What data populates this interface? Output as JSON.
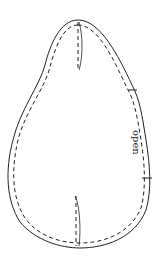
{
  "diagram": {
    "type": "sewing-pattern-piece",
    "label": "open",
    "label_orientation": "rotated 90deg clockwise",
    "elements": [
      {
        "name": "cut-line",
        "style": "solid"
      },
      {
        "name": "seam-line",
        "style": "dashed"
      },
      {
        "name": "top-dart",
        "style": "dashed with solid edge"
      },
      {
        "name": "bottom-dart",
        "style": "dashed with solid edge"
      },
      {
        "name": "notch-top",
        "side": "right"
      },
      {
        "name": "notch-bottom",
        "side": "right"
      }
    ],
    "colors": {
      "line": "#222222",
      "background": "#ffffff"
    }
  }
}
